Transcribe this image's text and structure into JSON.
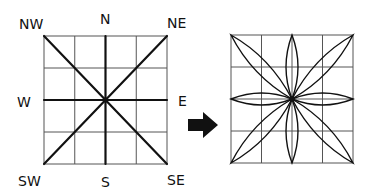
{
  "diagram": {
    "left_panel": {
      "grid": {
        "rows": 4,
        "cols": 4
      },
      "labels": {
        "nw": "NW",
        "n": "N",
        "ne": "NE",
        "w": "W",
        "e": "E",
        "sw": "SW",
        "s": "S",
        "se": "SE"
      },
      "lines": [
        "N-S",
        "E-W",
        "NW-SE",
        "NE-SW"
      ]
    },
    "arrow": {
      "direction": "right",
      "icon": "right-arrow-icon"
    },
    "right_panel": {
      "grid": {
        "rows": 4,
        "cols": 4
      },
      "petals": [
        "N",
        "NE",
        "E",
        "SE",
        "S",
        "SW",
        "W",
        "NW"
      ]
    },
    "colors": {
      "ink": "#111111",
      "grid": "#555555",
      "background": "#ffffff"
    }
  }
}
